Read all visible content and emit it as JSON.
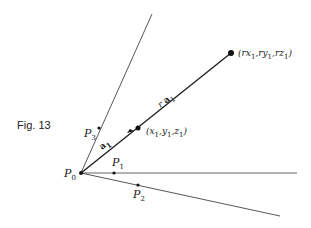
{
  "figure": {
    "caption": "Fig. 13",
    "line_color": "#333333",
    "points": {
      "p0": {
        "name": "P",
        "sub": "0"
      },
      "p1": {
        "name": "P",
        "sub": "1"
      },
      "p2": {
        "name": "P",
        "sub": "2"
      },
      "p3": {
        "name": "P",
        "sub": "3"
      }
    },
    "coords": {
      "near": {
        "text": "(x",
        "parts": [
          "(x",
          "1",
          ",y",
          "1",
          ",z",
          "1",
          ")"
        ]
      },
      "far": {
        "parts": [
          "(rx",
          "1",
          ",ry",
          "1",
          ",rz",
          "1",
          ")"
        ]
      }
    },
    "vectors": {
      "short": {
        "name": "a",
        "sub": "1"
      },
      "long": {
        "prefix": "r ",
        "name": "a",
        "sub": "1"
      }
    }
  }
}
